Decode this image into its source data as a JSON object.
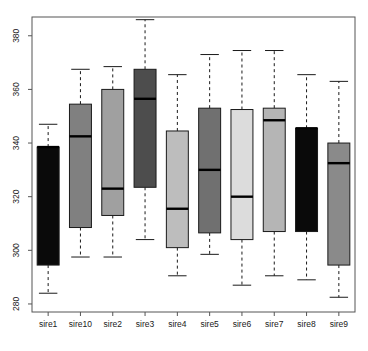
{
  "chart_data": {
    "type": "box",
    "title": "",
    "subtitle": "",
    "xlabel": "",
    "ylabel": "",
    "ylim": [
      277,
      387
    ],
    "yticks": [
      280,
      300,
      320,
      340,
      360,
      380
    ],
    "ytick_labels": [
      "280",
      "300",
      "320",
      "340",
      "360",
      "380"
    ],
    "grid": false,
    "legend": false,
    "legend_position": "none",
    "axis_color": "#555555",
    "box_border_color": "#1a1a1a",
    "median_color": "#000000",
    "whisker_style": "dashed",
    "categories": [
      "sire1",
      "sire10",
      "sire2",
      "sire3",
      "sire4",
      "sire5",
      "sire6",
      "sire7",
      "sire8",
      "sire9"
    ],
    "boxes": [
      {
        "label": "sire1",
        "lower_whisker": 284.0,
        "q1": 294.5,
        "median": 338.5,
        "q3": 338.5,
        "upper_whisker": 347.0,
        "fill": "#0a0a0a"
      },
      {
        "label": "sire10",
        "lower_whisker": 297.5,
        "q1": 308.5,
        "median": 342.5,
        "q3": 354.5,
        "upper_whisker": 367.5,
        "fill": "#808080"
      },
      {
        "label": "sire2",
        "lower_whisker": 297.5,
        "q1": 313.0,
        "median": 323.0,
        "q3": 360.0,
        "upper_whisker": 368.5,
        "fill": "#a0a0a0"
      },
      {
        "label": "sire3",
        "lower_whisker": 304.0,
        "q1": 323.5,
        "median": 356.5,
        "q3": 367.5,
        "upper_whisker": 386.0,
        "fill": "#4d4d4d"
      },
      {
        "label": "sire4",
        "lower_whisker": 290.5,
        "q1": 301.0,
        "median": 315.5,
        "q3": 344.5,
        "upper_whisker": 365.5,
        "fill": "#bdbdbd"
      },
      {
        "label": "sire5",
        "lower_whisker": 298.5,
        "q1": 306.5,
        "median": 330.0,
        "q3": 353.0,
        "upper_whisker": 373.0,
        "fill": "#707070"
      },
      {
        "label": "sire6",
        "lower_whisker": 287.0,
        "q1": 304.0,
        "median": 320.0,
        "q3": 352.5,
        "upper_whisker": 374.5,
        "fill": "#dcdcdc"
      },
      {
        "label": "sire7",
        "lower_whisker": 290.5,
        "q1": 307.0,
        "median": 348.5,
        "q3": 353.0,
        "upper_whisker": 374.5,
        "fill": "#b5b5b5"
      },
      {
        "label": "sire8",
        "lower_whisker": 289.0,
        "q1": 307.0,
        "median": 345.5,
        "q3": 345.5,
        "upper_whisker": 365.5,
        "fill": "#0a0a0a"
      },
      {
        "label": "sire9",
        "lower_whisker": 282.5,
        "q1": 294.5,
        "median": 332.5,
        "q3": 340.0,
        "upper_whisker": 363.0,
        "fill": "#8a8a8a"
      }
    ]
  }
}
